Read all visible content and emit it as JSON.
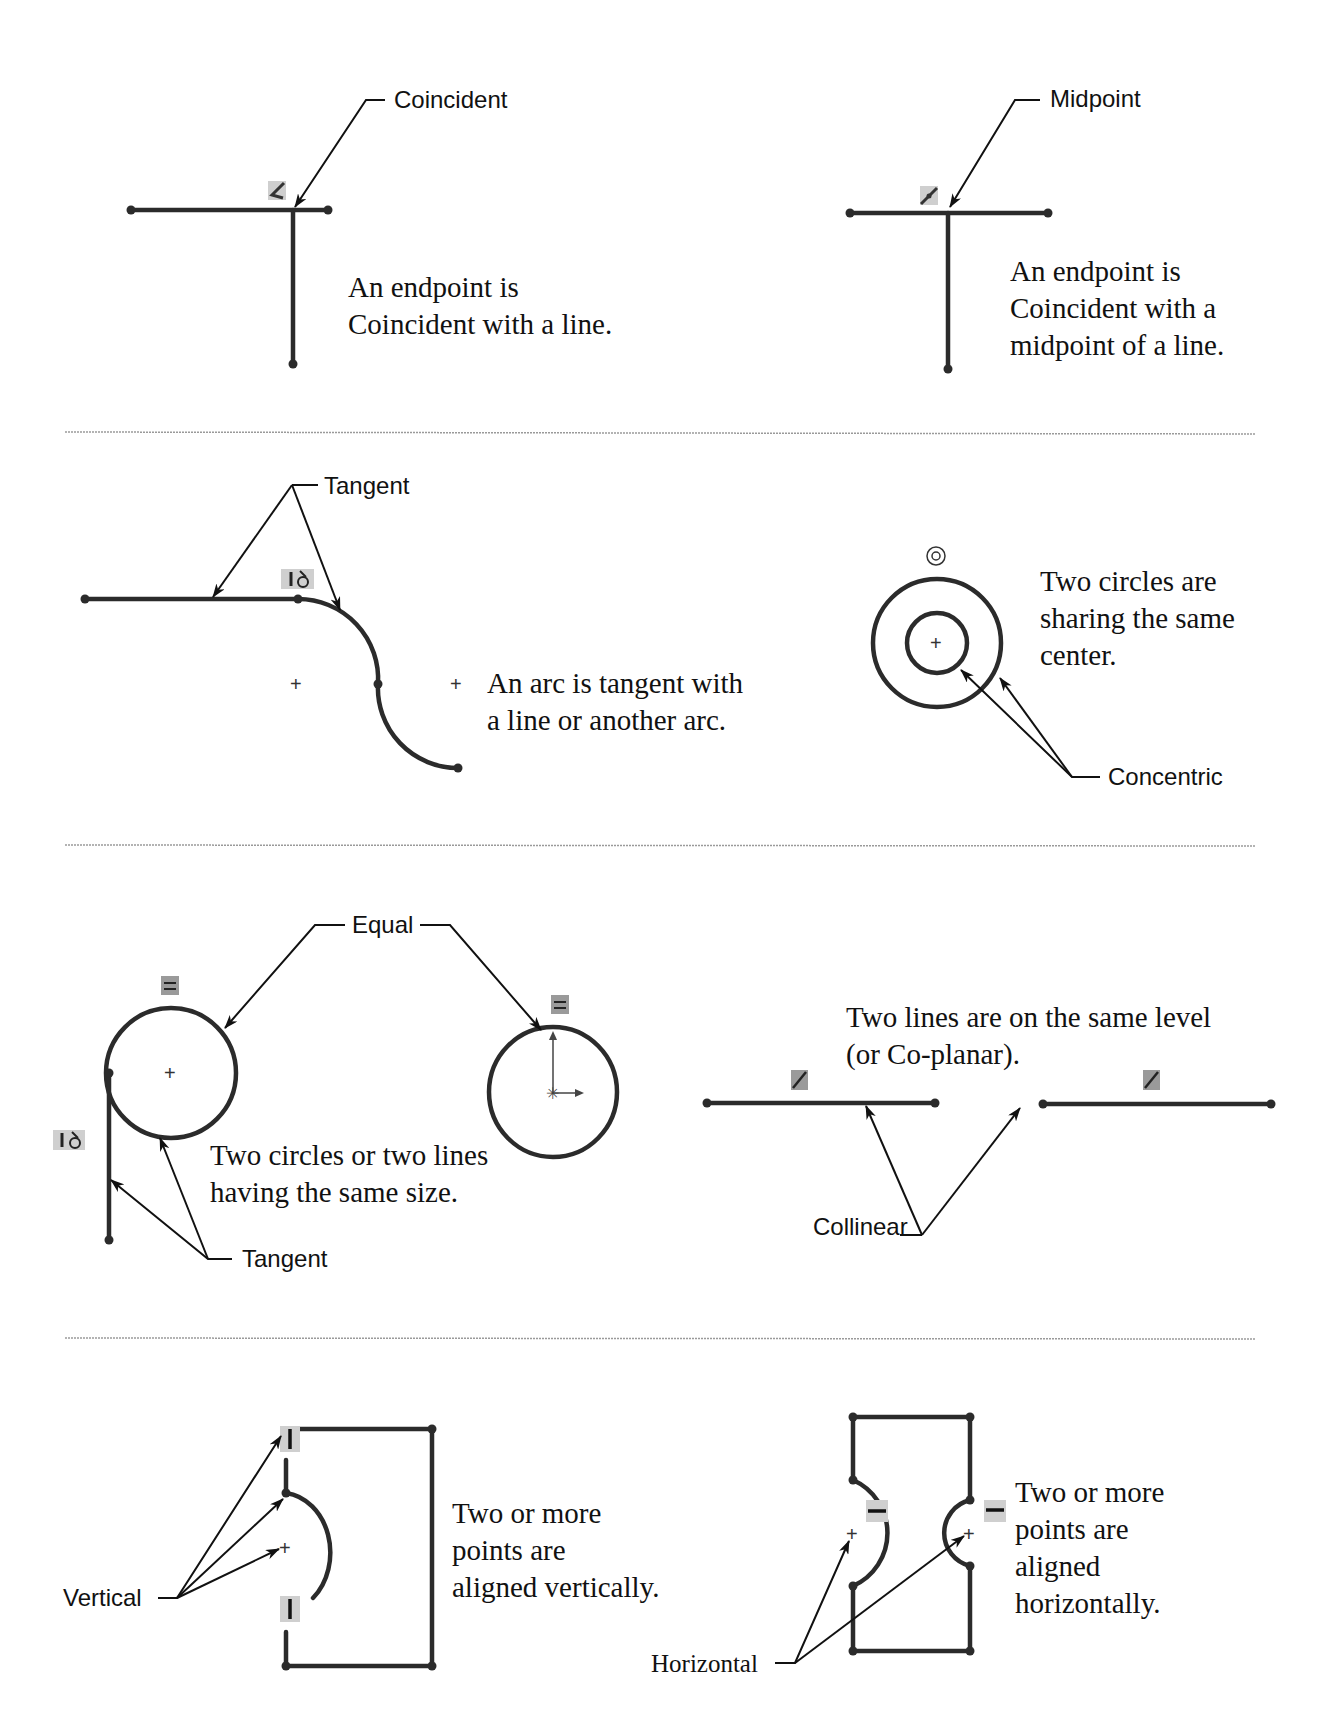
{
  "sections": [
    {
      "panels": [
        {
          "id": "coincident",
          "callout": "Coincident",
          "description": [
            "An endpoint is",
            "Coincident with a line."
          ]
        },
        {
          "id": "midpoint",
          "callout": "Midpoint",
          "description": [
            "An endpoint is",
            "Coincident with a",
            "midpoint of a line."
          ]
        }
      ]
    },
    {
      "panels": [
        {
          "id": "tangent",
          "callout": "Tangent",
          "description": [
            "An arc is tangent with",
            "a line or another arc."
          ]
        },
        {
          "id": "concentric",
          "callout": "Concentric",
          "description": [
            "Two circles are",
            "sharing the same",
            "center."
          ]
        }
      ]
    },
    {
      "panels": [
        {
          "id": "equal",
          "callout": "Equal",
          "secondary_callout": "Tangent",
          "description": [
            "Two circles or two lines",
            "having the same size."
          ]
        },
        {
          "id": "collinear",
          "callout": "Collinear",
          "description": [
            "Two lines are on the same level",
            "(or Co-planar)."
          ]
        }
      ]
    },
    {
      "panels": [
        {
          "id": "vertical",
          "callout": "Vertical",
          "description": [
            "Two or more",
            "points are",
            "aligned vertically."
          ]
        },
        {
          "id": "horizontal",
          "callout": "Horizontal",
          "description": [
            "Two or more",
            "points are",
            "aligned",
            "horizontally."
          ]
        }
      ]
    }
  ],
  "icons": {
    "coincident": "coincident-relation-icon",
    "midpoint": "midpoint-relation-icon",
    "tangent": "tangent-relation-icon",
    "concentric": "concentric-relation-icon",
    "equal": "equal-relation-icon",
    "collinear": "collinear-relation-icon",
    "vertical": "vertical-relation-icon",
    "horizontal": "horizontal-relation-icon"
  },
  "colors": {
    "geometry": "#2b2b2b",
    "badge": "#cfcfcf",
    "separator": "#9a9a9a"
  }
}
